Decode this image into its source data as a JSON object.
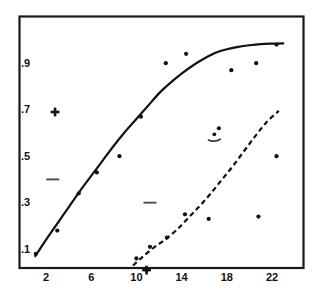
{
  "chart_data": {
    "type": "scatter",
    "title": "",
    "subtitle": "",
    "xlabel": "",
    "ylabel": "",
    "xlim": [
      0,
      24
    ],
    "ylim": [
      0,
      1.05
    ],
    "grid": false,
    "legend_position": "none",
    "x_ticks": [
      2,
      6,
      10,
      14,
      18,
      22
    ],
    "x_tick_labels": [
      "2",
      "6",
      "10",
      "14",
      "18",
      "22"
    ],
    "y_ticks": [
      0.1,
      0.3,
      0.5,
      0.7,
      0.9
    ],
    "y_tick_labels": [
      ".1",
      ".3",
      ".5",
      ".7",
      ".9"
    ],
    "series": [
      {
        "name": "upper-scatter",
        "marker": "dot",
        "points": [
          {
            "x": 1.1,
            "y": 0.075
          },
          {
            "x": 3.0,
            "y": 0.175
          },
          {
            "x": 4.9,
            "y": 0.335
          },
          {
            "x": 6.5,
            "y": 0.425
          },
          {
            "x": 8.5,
            "y": 0.495
          },
          {
            "x": 10.4,
            "y": 0.665
          },
          {
            "x": 12.6,
            "y": 0.895
          },
          {
            "x": 14.4,
            "y": 0.935
          },
          {
            "x": 17.3,
            "y": 0.615
          },
          {
            "x": 18.4,
            "y": 0.865
          },
          {
            "x": 20.6,
            "y": 0.895
          },
          {
            "x": 22.4,
            "y": 0.975
          }
        ]
      },
      {
        "name": "lower-scatter",
        "marker": "dot",
        "points": [
          {
            "x": 10.0,
            "y": 0.055
          },
          {
            "x": 11.2,
            "y": 0.105
          },
          {
            "x": 12.7,
            "y": 0.145
          },
          {
            "x": 14.3,
            "y": 0.245
          },
          {
            "x": 16.4,
            "y": 0.225
          },
          {
            "x": 20.8,
            "y": 0.235
          },
          {
            "x": 22.4,
            "y": 0.495
          }
        ]
      }
    ],
    "fitted_curves": [
      {
        "name": "solid-sigmoid-fit",
        "style": "solid",
        "points": [
          {
            "x": 1.05,
            "y": 0.065
          },
          {
            "x": 2.0,
            "y": 0.135
          },
          {
            "x": 3.0,
            "y": 0.205
          },
          {
            "x": 4.0,
            "y": 0.275
          },
          {
            "x": 5.0,
            "y": 0.345
          },
          {
            "x": 6.0,
            "y": 0.41
          },
          {
            "x": 7.0,
            "y": 0.475
          },
          {
            "x": 8.0,
            "y": 0.54
          },
          {
            "x": 9.0,
            "y": 0.6
          },
          {
            "x": 10.0,
            "y": 0.655
          },
          {
            "x": 11.0,
            "y": 0.71
          },
          {
            "x": 12.0,
            "y": 0.765
          },
          {
            "x": 13.0,
            "y": 0.81
          },
          {
            "x": 14.0,
            "y": 0.85
          },
          {
            "x": 15.0,
            "y": 0.885
          },
          {
            "x": 16.0,
            "y": 0.915
          },
          {
            "x": 17.0,
            "y": 0.94
          },
          {
            "x": 18.0,
            "y": 0.955
          },
          {
            "x": 19.0,
            "y": 0.965
          },
          {
            "x": 20.0,
            "y": 0.972
          },
          {
            "x": 21.0,
            "y": 0.977
          },
          {
            "x": 22.0,
            "y": 0.979
          },
          {
            "x": 23.0,
            "y": 0.98
          }
        ]
      },
      {
        "name": "dashed-exponential-fit",
        "style": "dashed",
        "points": [
          {
            "x": 9.7,
            "y": 0.025
          },
          {
            "x": 10.5,
            "y": 0.06
          },
          {
            "x": 11.5,
            "y": 0.1
          },
          {
            "x": 12.5,
            "y": 0.135
          },
          {
            "x": 13.5,
            "y": 0.175
          },
          {
            "x": 14.5,
            "y": 0.225
          },
          {
            "x": 15.5,
            "y": 0.275
          },
          {
            "x": 16.5,
            "y": 0.33
          },
          {
            "x": 17.5,
            "y": 0.39
          },
          {
            "x": 18.5,
            "y": 0.45
          },
          {
            "x": 19.5,
            "y": 0.515
          },
          {
            "x": 20.5,
            "y": 0.58
          },
          {
            "x": 21.5,
            "y": 0.64
          },
          {
            "x": 22.6,
            "y": 0.69
          }
        ]
      }
    ],
    "special_markers": [
      {
        "name": "plus-marker-left",
        "symbol": "plus",
        "x": 2.8,
        "y": 0.685
      },
      {
        "name": "plus-marker-bottom",
        "symbol": "plus",
        "x": 10.9,
        "y": 0.005
      },
      {
        "name": "dash-marker-left",
        "symbol": "dash",
        "x": 2.6,
        "y": 0.395
      },
      {
        "name": "dash-marker-mid",
        "symbol": "dash",
        "x": 11.2,
        "y": 0.295
      },
      {
        "name": "dot-arc-marker",
        "symbol": "dot-over-arc",
        "x": 16.9,
        "y": 0.575
      }
    ]
  }
}
